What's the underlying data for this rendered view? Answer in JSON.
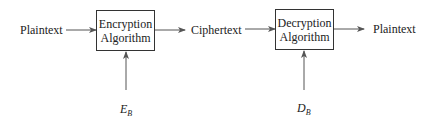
{
  "diagram": {
    "type": "flow",
    "nodes": {
      "input": "Plaintext",
      "encryption": {
        "line1": "Encryption",
        "line2": "Algorithm"
      },
      "middle": "Ciphertext",
      "decryption": {
        "line1": "Decryption",
        "line2": "Algorithm"
      },
      "output": "Plaintext"
    },
    "keys": {
      "encryption_key": {
        "base": "E",
        "sub": "B"
      },
      "decryption_key": {
        "base": "D",
        "sub": "B"
      }
    },
    "edges": [
      {
        "from": "Plaintext",
        "to": "Encryption Algorithm"
      },
      {
        "from": "Encryption Algorithm",
        "to": "Ciphertext"
      },
      {
        "from": "Ciphertext",
        "to": "Decryption Algorithm"
      },
      {
        "from": "Decryption Algorithm",
        "to": "Plaintext"
      },
      {
        "from": "E_B",
        "to": "Encryption Algorithm"
      },
      {
        "from": "D_B",
        "to": "Decryption Algorithm"
      }
    ]
  }
}
